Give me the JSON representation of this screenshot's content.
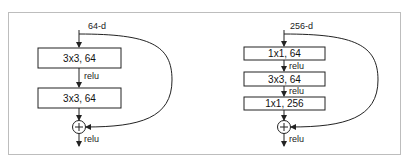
{
  "diagram": {
    "left_block": {
      "input_label": "64-d",
      "layers": [
        "3x3, 64",
        "3x3, 64"
      ],
      "activations": [
        "relu"
      ],
      "output_activation": "relu",
      "merge_symbol": "+"
    },
    "right_block": {
      "input_label": "256-d",
      "layers": [
        "1x1, 64",
        "3x3, 64",
        "1x1, 256"
      ],
      "activations": [
        "relu",
        "relu"
      ],
      "output_activation": "relu",
      "merge_symbol": "+"
    },
    "colors": {
      "stroke": "#222222",
      "frame": "#bdbdbd",
      "background": "#ffffff"
    }
  }
}
